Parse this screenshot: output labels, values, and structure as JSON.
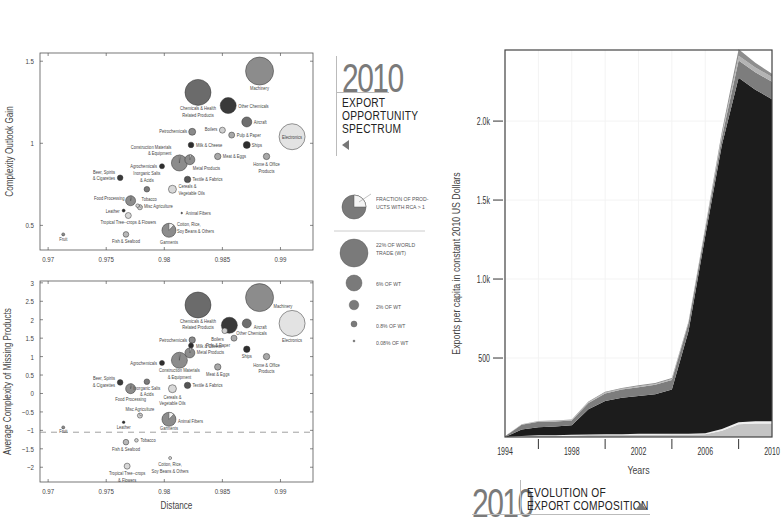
{
  "top_panel": {
    "year": "2010",
    "title_lines": [
      "EXPORT",
      "OPPORTUNITY",
      "SPECTRUM"
    ],
    "arrow": "triangle-left-icon"
  },
  "legend": {
    "pie_label_lines": [
      "FRACTION OF PROD-",
      "UCTS WITH RCA > 1"
    ],
    "sizes": [
      {
        "label_lines": [
          "22% OF WORLD",
          "TRADE (WT)"
        ],
        "r": 14
      },
      {
        "label_lines": [
          "6% OF WT"
        ],
        "r": 8
      },
      {
        "label_lines": [
          "2% OF WT"
        ],
        "r": 4.8
      },
      {
        "label_lines": [
          "0.8% OF WT"
        ],
        "r": 3
      },
      {
        "label_lines": [
          "0.08% OF WT"
        ],
        "r": 1
      }
    ]
  },
  "bottom_panel": {
    "year": "2010",
    "title_lines": [
      "EVOLUTION OF",
      "EXPORT COMPOSITION"
    ],
    "arrow": "triangle-up-icon"
  },
  "chart_data": [
    {
      "type": "scatter",
      "subtype": "bubble",
      "title": "",
      "xlabel": "",
      "ylabel": "Complexity Outlook Gain",
      "xlim": [
        0.9693,
        0.9928
      ],
      "ylim": [
        0.35,
        1.55
      ],
      "xticks": [
        "0.97",
        "0.975",
        "0.98",
        "0.985",
        "0.99"
      ],
      "yticks": [
        "0.5",
        "1",
        "1.5"
      ],
      "points": [
        {
          "label": "Machinery",
          "x": 0.9882,
          "y": 1.44,
          "r": 14,
          "color": "#8c8c8c",
          "lx": 0,
          "ly": 19
        },
        {
          "label": "Chemicals & Health|Related Products",
          "x": 0.9829,
          "y": 1.31,
          "r": 13,
          "color": "#6b6b6b",
          "lx": 0,
          "ly": 18
        },
        {
          "label": "Other Chemicals",
          "x": 0.9855,
          "y": 1.23,
          "r": 8,
          "color": "#3a3a3a",
          "lx": 10,
          "ly": 2,
          "anchor": "start"
        },
        {
          "label": "Aircraft",
          "x": 0.9871,
          "y": 1.13,
          "r": 5,
          "color": "#6e6e6e",
          "lx": 7,
          "ly": 2,
          "anchor": "start"
        },
        {
          "label": "Electronics",
          "x": 0.991,
          "y": 1.04,
          "r": 13,
          "color": "#e3e3e3",
          "lx": 0,
          "ly": 2
        },
        {
          "label": "Petrochemicals",
          "x": 0.9824,
          "y": 1.07,
          "r": 3.5,
          "color": "#8a8a8a",
          "lx": -5,
          "ly": 1,
          "anchor": "end"
        },
        {
          "label": "Boilers",
          "x": 0.985,
          "y": 1.08,
          "r": 3,
          "color": "#cfcfcf",
          "lx": -5,
          "ly": 1,
          "anchor": "end"
        },
        {
          "label": "Pulp & Paper",
          "x": 0.9858,
          "y": 1.05,
          "r": 3,
          "color": "#a8a8a8",
          "lx": 5,
          "ly": 2,
          "anchor": "start"
        },
        {
          "label": "Milk & Cheese",
          "x": 0.9823,
          "y": 0.99,
          "r": 2.8,
          "color": "#2e2e2e",
          "lx": 5,
          "ly": 2,
          "anchor": "start"
        },
        {
          "label": "Ships",
          "x": 0.9871,
          "y": 0.99,
          "r": 3.5,
          "color": "#2e2e2e",
          "lx": 5,
          "ly": 2,
          "anchor": "start"
        },
        {
          "label": "Construction Materials|& Equipment",
          "x": 0.9813,
          "y": 0.88,
          "r": 8,
          "color": "#8c8c8c",
          "lx": -8,
          "ly": -14,
          "anchor": "end",
          "pie": 0.02
        },
        {
          "label": "Metal Products",
          "x": 0.9822,
          "y": 0.9,
          "r": 5,
          "color": "#8c8c8c",
          "lx": 3,
          "ly": 10,
          "anchor": "start",
          "pie": 0.05
        },
        {
          "label": "Meat & Eggs",
          "x": 0.9846,
          "y": 0.92,
          "r": 3.2,
          "color": "#a8a8a8",
          "lx": 5,
          "ly": 2,
          "anchor": "start"
        },
        {
          "label": "Home & Office|Products",
          "x": 0.9888,
          "y": 0.92,
          "r": 3.2,
          "color": "#a8a8a8",
          "lx": 0,
          "ly": 10
        },
        {
          "label": "Agrochemicals",
          "x": 0.9798,
          "y": 0.86,
          "r": 2.5,
          "color": "#2e2e2e",
          "lx": -5,
          "ly": 2,
          "anchor": "end"
        },
        {
          "label": "Beer, Spirits|& Cigarettes",
          "x": 0.9762,
          "y": 0.79,
          "r": 2.8,
          "color": "#3a3a3a",
          "lx": -5,
          "ly": -4,
          "anchor": "end"
        },
        {
          "label": "Inorganic Salts|& Acids",
          "x": 0.9785,
          "y": 0.72,
          "r": 2.8,
          "color": "#7a7a7a",
          "lx": 0,
          "ly": -14
        },
        {
          "label": "Textile & Fabrics",
          "x": 0.982,
          "y": 0.78,
          "r": 3.2,
          "color": "#555555",
          "lx": 5,
          "ly": 2,
          "anchor": "start"
        },
        {
          "label": "Cereals &|Vegetable Oils",
          "x": 0.9807,
          "y": 0.72,
          "r": 4,
          "color": "#d8d8d8",
          "lx": 6,
          "ly": -1,
          "anchor": "start"
        },
        {
          "label": "Food Processing",
          "x": 0.9771,
          "y": 0.65,
          "r": 5,
          "color": "#8c8c8c",
          "lx": -6,
          "ly": -1,
          "anchor": "end",
          "pie": 0.03
        },
        {
          "label": "Tobacco",
          "x": 0.9777,
          "y": 0.62,
          "r": 1.8,
          "color": "#cfcfcf",
          "lx": 4,
          "ly": -5,
          "anchor": "start"
        },
        {
          "label": "Misc Agriculture",
          "x": 0.9779,
          "y": 0.61,
          "r": 2.5,
          "color": "#cfcfcf",
          "lx": 4,
          "ly": 1,
          "anchor": "start",
          "pie": 0.2
        },
        {
          "label": "Leather",
          "x": 0.9765,
          "y": 0.59,
          "r": 1.5,
          "color": "#2e2e2e",
          "lx": -4,
          "ly": 2,
          "anchor": "end"
        },
        {
          "label": "Animal Fibers",
          "x": 0.9815,
          "y": 0.575,
          "r": 0.8,
          "color": "#2e2e2e",
          "lx": 4,
          "ly": 2,
          "anchor": "start"
        },
        {
          "label": "Tropical Tree--crops & Flowers",
          "x": 0.9769,
          "y": 0.56,
          "r": 3,
          "color": "#d8d8d8",
          "lx": 0,
          "ly": 8
        },
        {
          "label": "Cotton, Rice,|Soy Beans & Others",
          "x": 0.9804,
          "y": 0.47,
          "r": 7,
          "color": "#8c8c8c",
          "lx": 8,
          "ly": -4,
          "anchor": "start",
          "pie": 0.12
        },
        {
          "label": "Garments",
          "x": 0.9804,
          "y": 0.47,
          "r": 0,
          "color": "#8c8c8c",
          "lx": 0,
          "ly": 14
        },
        {
          "label": "Fruit",
          "x": 0.9713,
          "y": 0.445,
          "r": 1.5,
          "color": "#8c8c8c",
          "lx": 0,
          "ly": 7
        },
        {
          "label": "Fish & Seafood",
          "x": 0.9767,
          "y": 0.445,
          "r": 2.8,
          "color": "#b8b8b8",
          "lx": 0,
          "ly": 9
        }
      ]
    },
    {
      "type": "scatter",
      "subtype": "bubble",
      "title": "",
      "xlabel": "Distance",
      "ylabel": "Average Complexity of Missing Products",
      "xlim": [
        0.9693,
        0.9928
      ],
      "ylim": [
        -2.4,
        3.05
      ],
      "xticks": [
        "0.97",
        "0.975",
        "0.98",
        "0.985",
        "0.99"
      ],
      "yticks": [
        "−2",
        "−1.5",
        "−1",
        "−0.5",
        "0",
        "0.5",
        "1",
        "1.5",
        "2",
        "2.5",
        "3"
      ],
      "reference_line_y": -1.05,
      "points": [
        {
          "label": "Machinery",
          "x": 0.9882,
          "y": 2.6,
          "r": 14,
          "color": "#8c8c8c",
          "lx": 14,
          "ly": 10,
          "anchor": "start"
        },
        {
          "label": "Chemicals & Health|Related Products",
          "x": 0.9829,
          "y": 2.4,
          "r": 13,
          "color": "#6b6b6b",
          "lx": 0,
          "ly": 18
        },
        {
          "label": "Aircraft",
          "x": 0.9871,
          "y": 1.9,
          "r": 4.5,
          "color": "#6e6e6e",
          "lx": 7,
          "ly": 6,
          "anchor": "start"
        },
        {
          "label": "Electronics",
          "x": 0.991,
          "y": 1.9,
          "r": 13,
          "color": "#e3e3e3",
          "lx": 0,
          "ly": 19
        },
        {
          "label": "Other Chemicals",
          "x": 0.9856,
          "y": 1.85,
          "r": 8,
          "color": "#3a3a3a",
          "lx": 7,
          "ly": 10,
          "anchor": "start"
        },
        {
          "label": "Boilers",
          "x": 0.9852,
          "y": 1.7,
          "r": 2.8,
          "color": "#cfcfcf",
          "lx": -1,
          "ly": 10,
          "anchor": "end"
        },
        {
          "label": "Pulp & Paper",
          "x": 0.986,
          "y": 1.5,
          "r": 3,
          "color": "#a8a8a8",
          "lx": -4,
          "ly": 9,
          "anchor": "end"
        },
        {
          "label": "Petrochemicals",
          "x": 0.9824,
          "y": 1.45,
          "r": 3.2,
          "color": "#8a8a8a",
          "lx": -5,
          "ly": 2,
          "anchor": "end"
        },
        {
          "label": "Milk & Cheese",
          "x": 0.9823,
          "y": 1.3,
          "r": 2.5,
          "color": "#2e2e2e",
          "lx": 5,
          "ly": 2,
          "anchor": "start"
        },
        {
          "label": "Metal Products",
          "x": 0.9822,
          "y": 1.1,
          "r": 5,
          "color": "#8c8c8c",
          "lx": 7,
          "ly": 1,
          "anchor": "start",
          "pie": 0.05
        },
        {
          "label": "Ships",
          "x": 0.9871,
          "y": 1.2,
          "r": 3.2,
          "color": "#2e2e2e",
          "lx": 0,
          "ly": 9
        },
        {
          "label": "Home & Office|Products",
          "x": 0.9888,
          "y": 1.0,
          "r": 3.2,
          "color": "#a8a8a8",
          "lx": 0,
          "ly": 10
        },
        {
          "label": "Agrochemicals",
          "x": 0.9798,
          "y": 0.83,
          "r": 2.5,
          "color": "#2e2e2e",
          "lx": -5,
          "ly": 2,
          "anchor": "end"
        },
        {
          "label": "Construction Materials|& Equipment",
          "x": 0.9813,
          "y": 0.9,
          "r": 8,
          "color": "#8c8c8c",
          "lx": 0,
          "ly": 12,
          "pie": 0.02
        },
        {
          "label": "Meat & Eggs",
          "x": 0.9846,
          "y": 0.72,
          "r": 3.2,
          "color": "#a8a8a8",
          "lx": 0,
          "ly": 9
        },
        {
          "label": "Beer, Spirits|& Cigarettes",
          "x": 0.9762,
          "y": 0.3,
          "r": 2.8,
          "color": "#3a3a3a",
          "lx": -5,
          "ly": -2,
          "anchor": "end"
        },
        {
          "label": "Inorganic Salts|& Acids",
          "x": 0.9785,
          "y": 0.32,
          "r": 2.8,
          "color": "#7a7a7a",
          "lx": 0,
          "ly": 8
        },
        {
          "label": "Food Processing",
          "x": 0.9771,
          "y": 0.13,
          "r": 5,
          "color": "#8c8c8c",
          "lx": 0,
          "ly": 12,
          "pie": 0.03
        },
        {
          "label": "Textile & Fabrics",
          "x": 0.982,
          "y": 0.22,
          "r": 3.2,
          "color": "#555555",
          "lx": 5,
          "ly": 2,
          "anchor": "start"
        },
        {
          "label": "Cereals &|Vegetable Oils",
          "x": 0.9807,
          "y": 0.13,
          "r": 4,
          "color": "#d8d8d8",
          "lx": 0,
          "ly": 10
        },
        {
          "label": "Misc Agriculture",
          "x": 0.9779,
          "y": -0.6,
          "r": 2.5,
          "color": "#cfcfcf",
          "lx": 0,
          "ly": -5,
          "pie": 0.2
        },
        {
          "label": "Animal Fibers",
          "x": 0.9804,
          "y": -0.7,
          "r": 7,
          "color": "#8c8c8c",
          "lx": 9,
          "ly": 4,
          "anchor": "start",
          "pie": 0.12
        },
        {
          "label": "Garments",
          "x": 0.9804,
          "y": -0.7,
          "r": 0,
          "color": "#8c8c8c",
          "lx": 0,
          "ly": 11
        },
        {
          "label": "Leather",
          "x": 0.9765,
          "y": -0.78,
          "r": 1.3,
          "color": "#2e2e2e",
          "lx": 0,
          "ly": 7
        },
        {
          "label": "Fruit",
          "x": 0.9713,
          "y": -0.92,
          "r": 1.5,
          "color": "#8c8c8c",
          "lx": 0,
          "ly": 6
        },
        {
          "label": "Tobacco",
          "x": 0.9776,
          "y": -1.27,
          "r": 1.8,
          "color": "#cfcfcf",
          "lx": 4,
          "ly": 2,
          "anchor": "start"
        },
        {
          "label": "Fish & Seafood",
          "x": 0.9767,
          "y": -1.32,
          "r": 2.8,
          "color": "#b8b8b8",
          "lx": 0,
          "ly": 9
        },
        {
          "label": "Cotton, Rice,|Soy Beans & Others",
          "x": 0.9805,
          "y": -1.75,
          "r": 1.5,
          "color": "#d8d8d8",
          "lx": 0,
          "ly": 8
        },
        {
          "label": "Tropical Tree--crops|& Flowers",
          "x": 0.9768,
          "y": -1.97,
          "r": 3,
          "color": "#d8d8d8",
          "lx": 0,
          "ly": 9
        }
      ]
    },
    {
      "type": "area",
      "stacked": true,
      "title": "",
      "xlabel": "Years",
      "ylabel": "Exports per capita in constant 2010 US Dollars",
      "xlim": [
        1994,
        2010
      ],
      "ylim": [
        0,
        2450
      ],
      "xticks": [
        "1994",
        "1998",
        "2002",
        "2006",
        "2010"
      ],
      "xminor": [
        1996,
        2000,
        2004,
        2008
      ],
      "yticks": [
        {
          "v": 500,
          "label": "500"
        },
        {
          "v": 1000,
          "label": "1.0k"
        },
        {
          "v": 1500,
          "label": "1.5k"
        },
        {
          "v": 2000,
          "label": "2.0k"
        }
      ],
      "x": [
        1994,
        1995,
        1996,
        1997,
        1998,
        1999,
        2000,
        2001,
        2002,
        2003,
        2004,
        2005,
        2006,
        2007,
        2008,
        2009,
        2010
      ],
      "series": [
        {
          "name": "light-base",
          "color": "#c4c4c4",
          "values": [
            0,
            5,
            8,
            8,
            10,
            12,
            14,
            14,
            15,
            15,
            16,
            16,
            18,
            40,
            80,
            85,
            85
          ]
        },
        {
          "name": "thin-white",
          "color": "#efefef",
          "values": [
            0,
            2,
            3,
            3,
            4,
            4,
            4,
            4,
            5,
            5,
            5,
            5,
            5,
            10,
            14,
            14,
            14
          ]
        },
        {
          "name": "dark-main",
          "color": "#1c1c1c",
          "values": [
            0,
            40,
            50,
            55,
            60,
            160,
            210,
            230,
            240,
            250,
            280,
            650,
            1250,
            1800,
            2180,
            2100,
            2040
          ]
        },
        {
          "name": "mid-gray",
          "color": "#7d7d7d",
          "values": [
            5,
            30,
            35,
            32,
            30,
            40,
            48,
            52,
            55,
            60,
            60,
            50,
            40,
            50,
            110,
            110,
            110
          ]
        },
        {
          "name": "light-cap",
          "color": "#b4b4b4",
          "values": [
            0,
            2,
            3,
            3,
            3,
            4,
            5,
            5,
            6,
            6,
            6,
            6,
            8,
            15,
            30,
            30,
            30
          ]
        },
        {
          "name": "top-gray",
          "color": "#8e8e8e",
          "values": [
            0,
            2,
            3,
            3,
            3,
            4,
            5,
            5,
            6,
            6,
            6,
            6,
            8,
            20,
            40,
            30,
            20
          ]
        }
      ]
    }
  ]
}
